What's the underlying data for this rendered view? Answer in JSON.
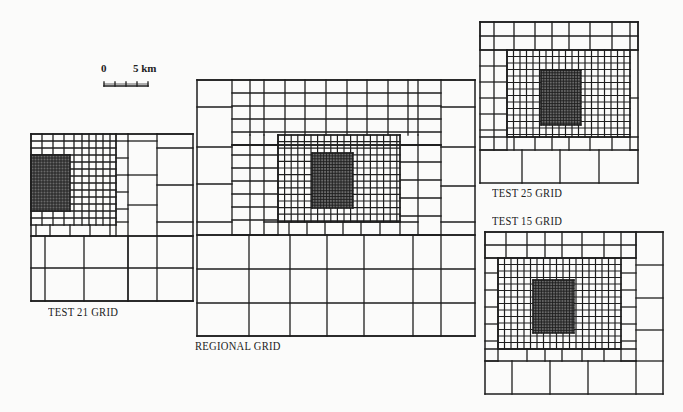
{
  "diagram": {
    "stroke_color": "#1e1e1e",
    "background": "#fbfbfa"
  },
  "scale_bar": {
    "start_label": "0",
    "end_label": "5 km",
    "x": 104,
    "y": 78,
    "width": 44,
    "ticks": 5
  },
  "labels": {
    "test21": "TEST 21 GRID",
    "regional": "REGIONAL GRID",
    "test25": "TEST 25 GRID",
    "test15": "TEST 15 GRID"
  },
  "grids": [
    {
      "id": "test21",
      "name": "TEST 21 GRID",
      "outer": [
        31,
        134,
        193,
        301
      ],
      "coarse_cols": [
        31,
        45,
        84,
        128,
        157,
        193
      ],
      "coarse_rows": [
        236,
        268,
        301
      ],
      "right_band": {
        "x0": 128,
        "x1": 193,
        "y0": 134,
        "y1": 236,
        "col_split": 157,
        "left_rows": [
          134,
          141,
          175,
          205,
          236
        ],
        "right_rows": [
          134,
          148,
          185,
          222,
          236
        ]
      },
      "mid": {
        "x0": 31,
        "x1": 128,
        "y0": 134,
        "y1": 236,
        "cols": [
          31,
          42,
          53,
          64,
          74,
          82,
          89,
          96,
          103,
          110,
          116,
          128
        ],
        "rows": [
          134,
          141,
          148,
          155,
          162,
          169,
          176,
          183,
          190,
          197,
          204,
          211,
          218,
          225,
          236
        ],
        "right_strip_rows": [
          134,
          141,
          158,
          175,
          192,
          209,
          222,
          236
        ]
      },
      "fine": {
        "x0": 31,
        "x1": 70,
        "y0": 155,
        "y1": 211,
        "step": 3
      }
    },
    {
      "id": "regional",
      "name": "REGIONAL GRID",
      "outer": [
        197,
        80,
        475,
        336
      ],
      "coarse_cols": [
        197,
        249,
        290,
        327,
        364,
        413,
        441,
        475
      ],
      "coarse_rows": [
        235,
        269,
        303,
        336
      ],
      "left_band_rows": [
        80,
        107,
        147,
        184,
        222,
        235
      ],
      "right_band_rows": [
        80,
        107,
        147,
        186,
        222,
        235
      ],
      "right_band_x": [
        441,
        475
      ],
      "left_band_x": [
        197,
        232
      ],
      "mid": {
        "x0": 232,
        "x1": 441,
        "y0": 80,
        "y1": 235,
        "cols": [
          232,
          250,
          264,
          285,
          305,
          326,
          347,
          367,
          388,
          408,
          418,
          441
        ],
        "rows": [
          80,
          93,
          106,
          119,
          132,
          145,
          235
        ],
        "left_rows": [
          145,
          155,
          168,
          181,
          194,
          207,
          220,
          235
        ],
        "right_rows": [
          145,
          162,
          180,
          198,
          216,
          235
        ]
      },
      "inner": {
        "x0": 278,
        "x1": 400,
        "y0": 135,
        "y1": 222,
        "step": 6.6
      },
      "fine": {
        "x0": 312,
        "x1": 353,
        "y0": 153,
        "y1": 208,
        "step": 2.9
      }
    },
    {
      "id": "test25",
      "name": "TEST 25 GRID",
      "outer": [
        480,
        22,
        638,
        183
      ],
      "coarse_cols": [
        480,
        522,
        560,
        599,
        638
      ],
      "coarse_rows": [
        150,
        183
      ],
      "top": {
        "x0": 480,
        "x1": 638,
        "y0": 22,
        "y1": 50,
        "cols": [
          480,
          494,
          514,
          535,
          552,
          569,
          590,
          612,
          630,
          638
        ],
        "rows": [
          22,
          36,
          50
        ]
      },
      "left_band": {
        "x0": 480,
        "x1": 507,
        "y0": 50,
        "y1": 150,
        "col_split": 494,
        "rows": [
          50,
          66,
          82,
          98,
          114,
          130,
          150
        ]
      },
      "right_band": {
        "x0": 630,
        "x1": 638,
        "y0": 50,
        "y1": 150,
        "rows": [
          50,
          98,
          150
        ]
      },
      "inner": {
        "x0": 507,
        "x1": 630,
        "y0": 50,
        "y1": 137,
        "step": 6.5
      },
      "fine": {
        "x0": 541,
        "x1": 581,
        "y0": 70,
        "y1": 125,
        "step": 2.8
      },
      "bottom_strip": {
        "y0": 137,
        "y1": 150,
        "cols": [
          480,
          494,
          514,
          535,
          552,
          569,
          590,
          612,
          630,
          638
        ]
      }
    },
    {
      "id": "test15",
      "name": "TEST 15 GRID",
      "outer": [
        485,
        232,
        663,
        394
      ],
      "coarse_cols": [
        485,
        512,
        550,
        588,
        636,
        663
      ],
      "coarse_rows": [
        361,
        394
      ],
      "right_band": {
        "x0": 636,
        "x1": 663,
        "y0": 232,
        "y1": 361,
        "rows": [
          232,
          265,
          298,
          330,
          361
        ]
      },
      "top": {
        "x0": 485,
        "x1": 636,
        "y0": 232,
        "y1": 258,
        "cols": [
          485,
          506,
          527,
          545,
          562,
          582,
          604,
          621,
          636
        ],
        "rows": [
          232,
          245,
          258
        ]
      },
      "left_band": {
        "x0": 485,
        "x1": 498,
        "y0": 258,
        "y1": 361,
        "rows": [
          258,
          273,
          290,
          307,
          324,
          341,
          361
        ]
      },
      "right_inner_band": {
        "x0": 621,
        "x1": 636,
        "y0": 258,
        "y1": 361,
        "rows": [
          258,
          273,
          290,
          307,
          324,
          341,
          361
        ]
      },
      "inner": {
        "x0": 498,
        "x1": 621,
        "y0": 258,
        "y1": 349,
        "step": 6.5
      },
      "fine": {
        "x0": 533,
        "x1": 574,
        "y0": 280,
        "y1": 333,
        "step": 2.8
      },
      "bottom_strip": {
        "y0": 349,
        "y1": 361,
        "cols": [
          485,
          506,
          527,
          545,
          562,
          582,
          604,
          621,
          636
        ]
      }
    }
  ]
}
